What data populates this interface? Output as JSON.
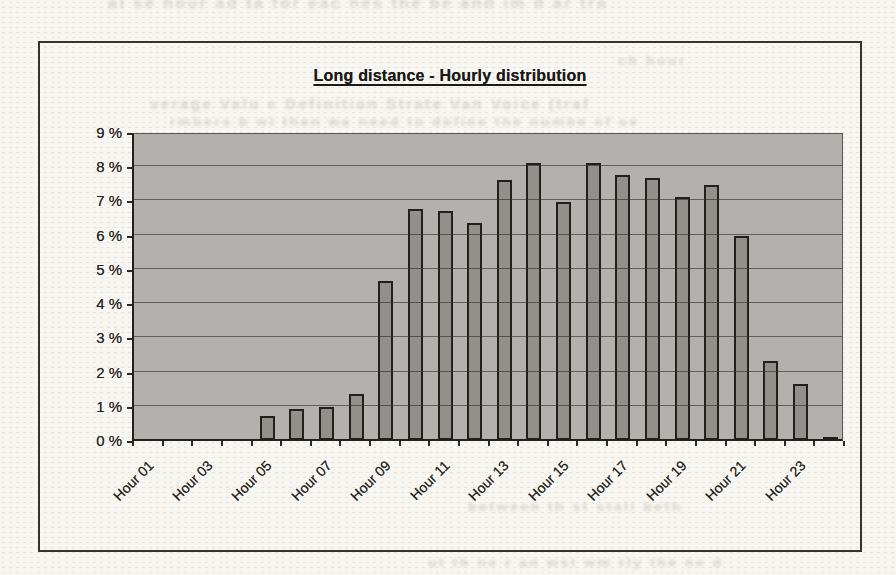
{
  "page": {
    "background_color": "#f8f6f1",
    "bleed_through_artifacts": [
      {
        "text": "al se hour ad  ta for eac  nes  the  be  and im  d ar  tra",
        "x": 108,
        "y": -6,
        "size": 16
      },
      {
        "text": "ch hour",
        "x": 618,
        "y": 52,
        "size": 14
      },
      {
        "text": "verage Valu e Definition Strate Van Voice (traf",
        "x": 150,
        "y": 95,
        "size": 15
      },
      {
        "text": "rmbers b wl then we need to define the numbe of se",
        "x": 170,
        "y": 113,
        "size": 14
      },
      {
        "text": "between th st stall beth",
        "x": 468,
        "y": 498,
        "size": 14
      },
      {
        "text": "ut th ne r an wst wm rly the ne d",
        "x": 428,
        "y": 554,
        "size": 14
      }
    ]
  },
  "chart_frame": {
    "border_color": "#35332e"
  },
  "chart_data": {
    "type": "bar",
    "title": "Long distance - Hourly distribution",
    "categories": [
      "Hour 01",
      "Hour 02",
      "Hour 03",
      "Hour 04",
      "Hour 05",
      "Hour 06",
      "Hour 07",
      "Hour 08",
      "Hour 09",
      "Hour 10",
      "Hour 11",
      "Hour 12",
      "Hour 13",
      "Hour 14",
      "Hour 15",
      "Hour 16",
      "Hour 17",
      "Hour 18",
      "Hour 19",
      "Hour 20",
      "Hour 21",
      "Hour 22",
      "Hour 23",
      "Hour 24"
    ],
    "values": [
      0,
      0,
      0,
      0,
      0.7,
      0.9,
      0.95,
      1.35,
      4.65,
      6.75,
      6.7,
      6.35,
      7.6,
      8.1,
      6.95,
      8.1,
      7.75,
      7.65,
      7.1,
      7.45,
      5.95,
      2.3,
      1.65,
      0.07
    ],
    "unit": "%",
    "xlabel": "",
    "ylabel": "",
    "ylim": [
      0,
      9
    ],
    "y_tick_step": 1,
    "y_tick_labels": [
      "9 %",
      "8 %",
      "7 %",
      "6 %",
      "5 %",
      "4 %",
      "3 %",
      "2 %",
      "1 %",
      "0 %"
    ],
    "x_tick_labels_shown": [
      "Hour 01",
      "Hour 03",
      "Hour 05",
      "Hour 07",
      "Hour 09",
      "Hour 11",
      "Hour 13",
      "Hour 15",
      "Hour 17",
      "Hour 19",
      "Hour 21",
      "Hour 23"
    ],
    "x_label_every": 2,
    "grid": true,
    "gridlines_over_bars": true,
    "legend": false,
    "plot_bg_color": "#b3b1ad",
    "bar_color": "#92908b",
    "bar_border_color": "#20201d",
    "gridline_color": "#2d2b26",
    "text_color": "#252420"
  }
}
